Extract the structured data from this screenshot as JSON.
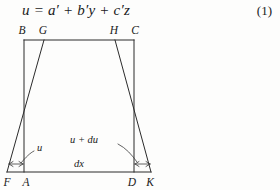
{
  "equation": {
    "text": "u = a′ + b′y + c′z",
    "number": "(1)"
  },
  "figure": {
    "vertex_labels": {
      "top_left_outer": "B",
      "top_left_inner": "G",
      "top_right_inner": "H",
      "top_right_outer": "C",
      "bottom_left_outer": "F",
      "bottom_left_inner": "A",
      "bottom_right_inner": "D",
      "bottom_right_outer": "K"
    },
    "annotations": {
      "left_displacement": "u",
      "right_displacement": "u + du",
      "baseline_length": "dx"
    },
    "colors": {
      "ink": "#2b2b2b",
      "paper": "#fdfdfc"
    }
  }
}
